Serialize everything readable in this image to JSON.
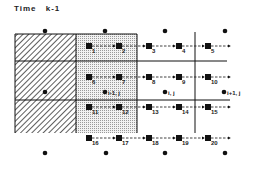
{
  "title": "Time  k-1",
  "diagram": {
    "columns": [
      {
        "name": "hatched",
        "x0": 15,
        "x1": 76
      },
      {
        "name": "stippled",
        "x0": 76,
        "x1": 137
      },
      {
        "name": "open-1",
        "x0": 137,
        "x1": 195
      },
      {
        "name": "open-2",
        "x0": 195,
        "x1": 240
      }
    ],
    "cell_centers": [
      {
        "x": 45,
        "y": 31,
        "label": ""
      },
      {
        "x": 105,
        "y": 31,
        "label": ""
      },
      {
        "x": 165,
        "y": 31,
        "label": ""
      },
      {
        "x": 225,
        "y": 31,
        "label": ""
      },
      {
        "x": 45,
        "y": 92,
        "label": ""
      },
      {
        "x": 105,
        "y": 92,
        "label": "i-1, j"
      },
      {
        "x": 165,
        "y": 92,
        "label": "i, j"
      },
      {
        "x": 224,
        "y": 92,
        "label": "i+1, j"
      },
      {
        "x": 45,
        "y": 153,
        "label": ""
      },
      {
        "x": 106,
        "y": 153,
        "label": ""
      },
      {
        "x": 165,
        "y": 153,
        "label": ""
      },
      {
        "x": 225,
        "y": 153,
        "label": ""
      }
    ],
    "node_rows": [
      {
        "y": 46,
        "nodes": [
          {
            "x": 89,
            "label": "1"
          },
          {
            "x": 119,
            "label": "2"
          },
          {
            "x": 149,
            "label": "3"
          },
          {
            "x": 179,
            "label": "4"
          },
          {
            "x": 208,
            "label": "5"
          }
        ]
      },
      {
        "y": 77,
        "nodes": [
          {
            "x": 89,
            "label": "6"
          },
          {
            "x": 119,
            "label": "7"
          },
          {
            "x": 149,
            "label": "8"
          },
          {
            "x": 179,
            "label": "9"
          },
          {
            "x": 208,
            "label": "10"
          }
        ]
      },
      {
        "y": 107,
        "nodes": [
          {
            "x": 89,
            "label": "11"
          },
          {
            "x": 119,
            "label": "12"
          },
          {
            "x": 149,
            "label": "13"
          },
          {
            "x": 179,
            "label": "14"
          },
          {
            "x": 208,
            "label": "15"
          }
        ]
      },
      {
        "y": 138,
        "nodes": [
          {
            "x": 89,
            "label": "16"
          },
          {
            "x": 119,
            "label": "17"
          },
          {
            "x": 149,
            "label": "18"
          },
          {
            "x": 179,
            "label": "19"
          },
          {
            "x": 208,
            "label": "20"
          }
        ]
      }
    ],
    "colors": {
      "ink": "#111111",
      "stipple": "#d8d8d8",
      "hatch": "#333333"
    }
  }
}
